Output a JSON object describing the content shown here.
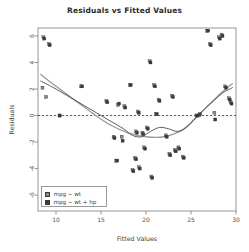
{
  "chart_data": {
    "type": "scatter",
    "title": "Residuals vs Fitted Values",
    "xlabel": "Fitted Values",
    "ylabel": "Residuals",
    "xlim": [
      8.0,
      30.0
    ],
    "ylim": [
      -7.2,
      6.6
    ],
    "xticks": [
      10,
      15,
      20,
      25,
      30
    ],
    "yticks": [
      6,
      4,
      2,
      0,
      -2,
      -4,
      -6
    ],
    "xticklabels": [
      "10",
      "15",
      "20",
      "25",
      "30"
    ],
    "yticklabels": [
      "6",
      "4",
      "2",
      "0",
      "-2",
      "-4",
      "-6"
    ],
    "grid": false,
    "reference_line": {
      "type": "hline",
      "y": 0,
      "style": "dashed",
      "color": "#333333"
    },
    "legend": {
      "position": "bottom-left",
      "entries": [
        {
          "label": "mpg ~ wt",
          "color": "#8a8a8a",
          "marker": "square"
        },
        {
          "label": "mpg ~ wt + hp",
          "color": "#3a3a3a",
          "marker": "square"
        }
      ]
    },
    "series": [
      {
        "name": "mpg ~ wt",
        "color": "#8a8a8a",
        "marker": "square",
        "points": [
          [
            8.6,
            5.9
          ],
          [
            8.5,
            2.1
          ],
          [
            8.9,
            1.4
          ],
          [
            9.2,
            5.4
          ],
          [
            10.4,
            0.0
          ],
          [
            12.8,
            2.2
          ],
          [
            15.6,
            1.1
          ],
          [
            16.4,
            -1.6
          ],
          [
            16.7,
            -3.4
          ],
          [
            16.9,
            0.8
          ],
          [
            17.3,
            -1.6
          ],
          [
            17.6,
            0.7
          ],
          [
            18.2,
            2.3
          ],
          [
            18.5,
            -4.1
          ],
          [
            18.8,
            -3.2
          ],
          [
            18.9,
            -1.2
          ],
          [
            19.1,
            0.3
          ],
          [
            19.2,
            -3.9
          ],
          [
            19.6,
            -1.3
          ],
          [
            19.8,
            -2.4
          ],
          [
            20.1,
            -0.9
          ],
          [
            20.4,
            4.1
          ],
          [
            20.6,
            -4.6
          ],
          [
            20.9,
            2.3
          ],
          [
            21.1,
            0.1
          ],
          [
            21.4,
            1.2
          ],
          [
            22.2,
            -1.5
          ],
          [
            22.6,
            -2.9
          ],
          [
            22.9,
            1.5
          ],
          [
            23.2,
            -2.6
          ],
          [
            23.6,
            -2.4
          ],
          [
            24.1,
            -3.1
          ],
          [
            25.6,
            0.0
          ],
          [
            25.9,
            0.0
          ],
          [
            26.8,
            6.4
          ],
          [
            27.1,
            5.4
          ],
          [
            27.6,
            0.2
          ],
          [
            28.1,
            5.9
          ],
          [
            28.4,
            6.1
          ],
          [
            28.8,
            2.2
          ],
          [
            29.2,
            1.3
          ],
          [
            29.4,
            1.0
          ]
        ]
      },
      {
        "name": "mpg ~ wt + hp",
        "color": "#3a3a3a",
        "marker": "square",
        "points": [
          [
            8.7,
            5.8
          ],
          [
            9.3,
            5.3
          ],
          [
            10.4,
            0.0
          ],
          [
            12.9,
            2.2
          ],
          [
            15.7,
            1.0
          ],
          [
            16.5,
            -1.7
          ],
          [
            16.8,
            -3.4
          ],
          [
            17.0,
            0.9
          ],
          [
            17.4,
            -1.9
          ],
          [
            17.7,
            0.6
          ],
          [
            18.3,
            2.3
          ],
          [
            18.6,
            -4.2
          ],
          [
            18.9,
            -3.3
          ],
          [
            19.0,
            -1.3
          ],
          [
            19.2,
            0.2
          ],
          [
            19.3,
            -4.0
          ],
          [
            19.7,
            -1.4
          ],
          [
            19.9,
            -2.5
          ],
          [
            20.2,
            -1.0
          ],
          [
            20.5,
            4.0
          ],
          [
            20.7,
            -4.7
          ],
          [
            21.0,
            2.2
          ],
          [
            21.2,
            0.1
          ],
          [
            21.5,
            1.1
          ],
          [
            22.3,
            -1.6
          ],
          [
            22.7,
            -3.0
          ],
          [
            23.0,
            1.4
          ],
          [
            23.3,
            -2.7
          ],
          [
            23.7,
            -2.5
          ],
          [
            24.2,
            -3.2
          ],
          [
            25.7,
            0.0
          ],
          [
            26.0,
            0.1
          ],
          [
            26.9,
            6.4
          ],
          [
            27.2,
            5.3
          ],
          [
            27.7,
            -0.3
          ],
          [
            28.2,
            5.8
          ],
          [
            28.5,
            6.0
          ],
          [
            28.9,
            2.1
          ],
          [
            29.3,
            1.2
          ],
          [
            29.5,
            0.9
          ]
        ]
      }
    ],
    "smoothers": [
      {
        "name": "mpg ~ wt smoother",
        "color": "#9a9a9a",
        "points": [
          [
            8.3,
            3.1
          ],
          [
            10.0,
            2.2
          ],
          [
            12.0,
            1.2
          ],
          [
            14.0,
            0.2
          ],
          [
            16.0,
            -0.7
          ],
          [
            18.0,
            -1.3
          ],
          [
            20.0,
            -1.6
          ],
          [
            22.0,
            -1.6
          ],
          [
            24.0,
            -1.1
          ],
          [
            25.5,
            -0.2
          ],
          [
            27.0,
            0.8
          ],
          [
            28.5,
            1.8
          ],
          [
            29.6,
            2.4
          ]
        ]
      },
      {
        "name": "mpg ~ wt + hp smoother",
        "color": "#4a4a4a",
        "points": [
          [
            8.3,
            2.6
          ],
          [
            10.0,
            2.0
          ],
          [
            12.0,
            1.2
          ],
          [
            14.0,
            0.4
          ],
          [
            16.0,
            -0.4
          ],
          [
            17.5,
            -1.0
          ],
          [
            18.5,
            -1.5
          ],
          [
            19.5,
            -1.6
          ],
          [
            20.5,
            -1.2
          ],
          [
            21.5,
            -0.9
          ],
          [
            22.5,
            -1.0
          ],
          [
            23.5,
            -1.2
          ],
          [
            24.5,
            -0.9
          ],
          [
            25.5,
            -0.2
          ],
          [
            26.5,
            0.5
          ],
          [
            27.5,
            1.1
          ],
          [
            28.5,
            1.7
          ],
          [
            29.6,
            2.1
          ]
        ]
      }
    ]
  },
  "plot_geometry": {
    "frame_left": 38,
    "frame_right": 236,
    "frame_top": 28,
    "frame_bottom": 211
  }
}
